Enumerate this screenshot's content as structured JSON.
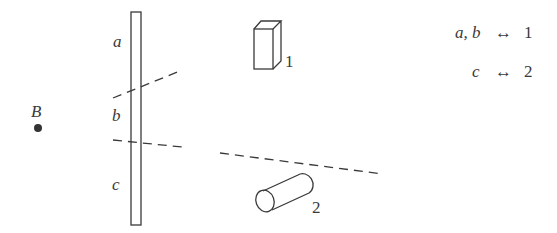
{
  "diagram": {
    "point": {
      "label": "B"
    },
    "strip": {
      "regions": [
        {
          "label": "a"
        },
        {
          "label": "b"
        },
        {
          "label": "c"
        }
      ]
    },
    "objects": [
      {
        "id": "box",
        "label": "1"
      },
      {
        "id": "cylinder",
        "label": "2"
      }
    ],
    "legend": {
      "row1": {
        "left": "a, b",
        "arrow": "↔",
        "right": "1"
      },
      "row2": {
        "left": "c",
        "arrow": "↔",
        "right": "2"
      }
    }
  }
}
